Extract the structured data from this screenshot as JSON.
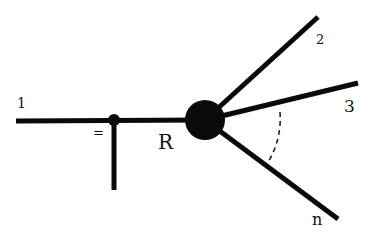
{
  "diagram": {
    "type": "feynman-like vertex diagram",
    "colors": {
      "line": "#0a0a0a",
      "background": "#ffffff",
      "dash": "#222222"
    },
    "labels": {
      "incoming": "1",
      "equals": "=",
      "blob": "R",
      "out_2": "2",
      "out_3": "3",
      "out_n": "n"
    },
    "nodes": {
      "small_vertex": {
        "x": 114,
        "y": 120,
        "r": 5
      },
      "blob": {
        "x": 205,
        "y": 120,
        "r": 20
      }
    },
    "lines": [
      {
        "name": "incoming-line-1",
        "x1": 16,
        "y1": 121,
        "x2": 205,
        "y2": 120
      },
      {
        "name": "vertical-stub-line",
        "x1": 114,
        "y1": 120,
        "x2": 114,
        "y2": 190
      },
      {
        "name": "outgoing-line-2",
        "x1": 205,
        "y1": 120,
        "x2": 318,
        "y2": 17
      },
      {
        "name": "outgoing-line-3",
        "x1": 205,
        "y1": 120,
        "x2": 358,
        "y2": 83
      },
      {
        "name": "outgoing-line-n",
        "x1": 205,
        "y1": 120,
        "x2": 338,
        "y2": 219
      }
    ]
  }
}
